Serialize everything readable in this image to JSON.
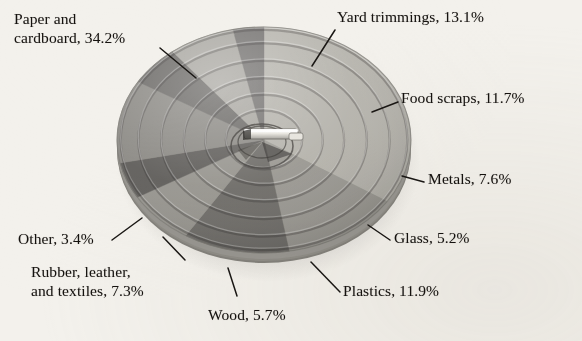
{
  "chart_data": {
    "type": "pie",
    "title": "",
    "subtitle": "",
    "xlabel": "",
    "ylabel": "",
    "legend_position": "callout-labels",
    "grid": false,
    "style": "3d-perspective-pie-with-concentric-rings",
    "units": "percent",
    "total": 100.1,
    "categories": [
      "Paper and cardboard",
      "Yard trimmings",
      "Food scraps",
      "Metals",
      "Glass",
      "Plastics",
      "Wood",
      "Rubber, leather, and textiles",
      "Other"
    ],
    "values": [
      34.2,
      13.1,
      11.7,
      7.6,
      5.2,
      11.9,
      5.7,
      7.3,
      3.4
    ],
    "slices": [
      {
        "name": "Paper and cardboard",
        "value": 34.2,
        "label": "Paper and\ncardboard, 34.2%",
        "label_line1": "Paper and",
        "label_line2": "cardboard, 34.2%",
        "color": "#b6b4ad",
        "start_deg": 0,
        "end_deg": 123.1
      },
      {
        "name": "Yard trimmings",
        "value": 13.1,
        "label": "Yard trimmings, 13.1%",
        "color": "#9b9993",
        "start_deg": 312.8,
        "end_deg": 360
      },
      {
        "name": "Food scraps",
        "value": 11.7,
        "label": "Food scraps, 11.7%",
        "color": "#6e6c68",
        "start_deg": 270.7,
        "end_deg": 312.8
      },
      {
        "name": "Metals",
        "value": 7.6,
        "label": "Metals, 7.6%",
        "color": "#97958f",
        "start_deg": 243.3,
        "end_deg": 270.7
      },
      {
        "name": "Glass",
        "value": 5.2,
        "label": "Glass, 5.2%",
        "color": "#5f5d5a",
        "start_deg": 224.6,
        "end_deg": 243.3
      },
      {
        "name": "Plastics",
        "value": 11.9,
        "label": "Plastics, 11.9%",
        "color": "#8b8984",
        "start_deg": 181.8,
        "end_deg": 224.6
      },
      {
        "name": "Wood",
        "value": 5.7,
        "label": "Wood, 5.7%",
        "color": "#6a6865",
        "start_deg": 161.3,
        "end_deg": 181.8
      },
      {
        "name": "Rubber, leather, and textiles",
        "value": 7.3,
        "label": "Rubber, leather,\nand textiles, 7.3%",
        "label_line1": "Rubber, leather,",
        "label_line2": "and textiles, 7.3%",
        "color": "#a8a6a0",
        "start_deg": 135.0,
        "end_deg": 161.3
      },
      {
        "name": "Other",
        "value": 3.4,
        "label": "Other, 3.4%",
        "color": "#747270",
        "start_deg": 123.1,
        "end_deg": 135.0
      }
    ]
  },
  "labels": {
    "paper_line1": "Paper and",
    "paper_line2": "cardboard, 34.2%",
    "yard": "Yard trimmings, 13.1%",
    "food": "Food scraps, 11.7%",
    "metals": "Metals, 7.6%",
    "glass": "Glass, 5.2%",
    "plastics": "Plastics, 11.9%",
    "wood": "Wood, 5.7%",
    "rubber_line1": "Rubber, leather,",
    "rubber_line2": "and textiles, 7.3%",
    "other": "Other, 3.4%"
  },
  "colors": {
    "background": "#f3f1ec",
    "text": "#15120f",
    "leader_line": "#1a1714",
    "pie_rim": "#8a8882",
    "hub_light": "#f2f0ea",
    "hub_shadow": "#4a4845"
  }
}
